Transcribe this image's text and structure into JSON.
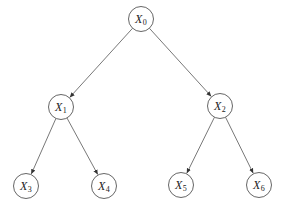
{
  "diagram": {
    "type": "binary-tree",
    "node_radius": 12.5,
    "colors": {
      "stroke": "#555555",
      "text": "#222222",
      "background": "#ffffff"
    },
    "nodes": [
      {
        "id": "X0",
        "base": "X",
        "sub": "0",
        "x": 141,
        "y": 19
      },
      {
        "id": "X1",
        "base": "X",
        "sub": "1",
        "x": 61,
        "y": 107
      },
      {
        "id": "X2",
        "base": "X",
        "sub": "2",
        "x": 220,
        "y": 106
      },
      {
        "id": "X3",
        "base": "X",
        "sub": "3",
        "x": 26,
        "y": 186
      },
      {
        "id": "X4",
        "base": "X",
        "sub": "4",
        "x": 104,
        "y": 186
      },
      {
        "id": "X5",
        "base": "X",
        "sub": "5",
        "x": 181,
        "y": 185
      },
      {
        "id": "X6",
        "base": "X",
        "sub": "6",
        "x": 259,
        "y": 185
      }
    ],
    "edges": [
      {
        "from": "X0",
        "to": "X1"
      },
      {
        "from": "X0",
        "to": "X2"
      },
      {
        "from": "X1",
        "to": "X3"
      },
      {
        "from": "X1",
        "to": "X4"
      },
      {
        "from": "X2",
        "to": "X5"
      },
      {
        "from": "X2",
        "to": "X6"
      }
    ]
  }
}
